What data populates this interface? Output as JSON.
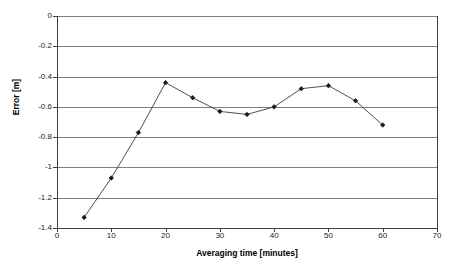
{
  "chart_data": {
    "type": "line",
    "title": "",
    "xlabel": "Averaging time [minutes]",
    "ylabel": "Error [m]",
    "xlim": [
      0,
      70
    ],
    "ylim": [
      -1.4,
      0
    ],
    "grid": "horizontal",
    "legend": "none",
    "marker": "diamond",
    "line_color": "#3a3a4a",
    "marker_color": "#1a1a1a",
    "grid_color": "#808080",
    "axis_color": "#404040",
    "background": "#ffffff",
    "xticks": [
      0,
      10,
      20,
      30,
      40,
      50,
      60,
      70
    ],
    "xtick_labels": [
      "0",
      "10",
      "20",
      "30",
      "40",
      "50",
      "60",
      "70"
    ],
    "yticks": [
      0,
      -0.2,
      -0.4,
      -0.6,
      -0.8,
      -1,
      -1.2,
      -1.4
    ],
    "ytick_labels": [
      "0",
      "-0.2",
      "-0.4",
      "-0.6",
      "-0.8",
      "-1",
      "-1.2",
      "-1.4"
    ],
    "x": [
      5,
      10,
      15,
      20,
      25,
      30,
      35,
      40,
      45,
      50,
      55,
      60
    ],
    "values": [
      -1.33,
      -1.07,
      -0.77,
      -0.44,
      -0.54,
      -0.63,
      -0.65,
      -0.6,
      -0.48,
      -0.46,
      -0.56,
      -0.72
    ],
    "series": [
      {
        "name": "Error",
        "x": [
          5,
          10,
          15,
          20,
          25,
          30,
          35,
          40,
          45,
          50,
          55,
          60
        ],
        "values": [
          -1.33,
          -1.07,
          -0.77,
          -0.44,
          -0.54,
          -0.63,
          -0.65,
          -0.6,
          -0.48,
          -0.46,
          -0.56,
          -0.72
        ]
      }
    ]
  }
}
